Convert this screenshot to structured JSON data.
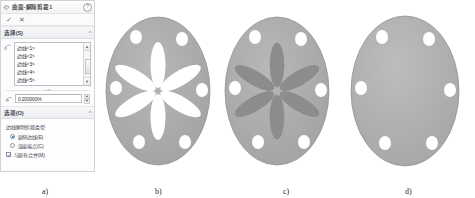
{
  "panel": {
    "title": "曲面-解除剪裁1",
    "title_icon": "surface-untrim-icon",
    "help_icon": "help-icon",
    "ok_label": "✓",
    "cancel_label": "✕",
    "ok_icon": "checkmark-icon",
    "cancel_icon": "close-icon",
    "selection": {
      "header": "选择(S)",
      "collapse_icon": "chevron-up-icon",
      "picker_icon": "edge-select-icon",
      "items": [
        "边线<1>",
        "边线<2>",
        "边线<3>",
        "边线<4>",
        "边线<5>"
      ],
      "scroll_up_icon": "scroll-up-icon",
      "scroll_down_icon": "scroll-down-icon",
      "percent_icon": "extend-percent-icon",
      "percent_value": "0.200000%",
      "spin_up_icon": "spinner-up-icon",
      "spin_down_icon": "spinner-down-icon"
    },
    "options": {
      "header": "选项(O)",
      "collapse_icon": "chevron-up-icon",
      "type_label": "边线解除剪裁类型",
      "radio_extend": "延伸边线(E)",
      "radio_connect": "连接端点(C)",
      "radio_selected": "extend",
      "checkbox_label": "与原有合并(M)",
      "checkbox_checked": true
    }
  },
  "figures": [
    {
      "id": "a",
      "caption": "a)"
    },
    {
      "id": "b",
      "caption": "b)"
    },
    {
      "id": "c",
      "caption": "c)"
    },
    {
      "id": "d",
      "caption": "d)"
    }
  ],
  "colors": {
    "body_gray": "#adadad",
    "body_gray_dark": "#9b9b9b",
    "mesh_gray": "#8f8f8f",
    "hole_white": "#ffffff",
    "panel_bg": "#fdfdfd",
    "accent_blue": "#2c6fb5",
    "ok_green": "#4a9b3f"
  }
}
